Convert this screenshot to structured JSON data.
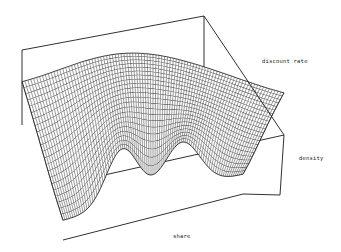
{
  "chart_data": {
    "type": "surface3d",
    "title": "",
    "axes": {
      "x": {
        "label": "share",
        "range": [
          0,
          1
        ]
      },
      "y": {
        "label": "discount rate",
        "range": [
          0,
          1
        ]
      },
      "z": {
        "label": "density",
        "range": [
          0,
          1
        ]
      }
    },
    "surface_model": {
      "share_peaks": [
        {
          "center": 0.33,
          "width": 0.09,
          "height_near": 1.0,
          "height_far": 0.55
        },
        {
          "center": 0.66,
          "width": 0.1,
          "height_near": 0.85,
          "height_far": 0.45
        }
      ],
      "baseline_near": 0.35,
      "baseline_far": 0.55,
      "grid_share": 90,
      "grid_discount": 22
    },
    "grid": false,
    "legend": "none",
    "colors": {
      "line": "#222222",
      "background": "#ffffff"
    }
  }
}
